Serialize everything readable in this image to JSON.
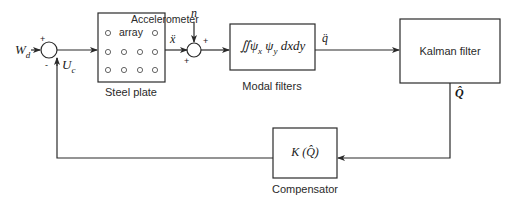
{
  "diagram": {
    "type": "block-diagram",
    "inputs": {
      "disturbance": "W",
      "disturbance_sub": "d",
      "control": "U",
      "control_sub": "c",
      "noise": "n"
    },
    "junctions": [
      {
        "id": "sum1",
        "signs": {
          "left": "+",
          "bottom": "-"
        }
      },
      {
        "id": "sum2",
        "signs": {
          "top": "+",
          "bottom_left": "+"
        }
      }
    ],
    "blocks": {
      "steel_plate": {
        "title_line1": "Accelerometer",
        "title_line2": "array",
        "caption": "Steel plate"
      },
      "modal_filters": {
        "expression": "∬ψ",
        "psi_x_sub": "x",
        "psi_y": "ψ",
        "psi_y_sub": "y",
        "differential": "dxdy",
        "caption": "Modal filters"
      },
      "kalman": {
        "label": "Kalman filter"
      },
      "compensator": {
        "expression": "K (Q̂)",
        "caption": "Compensator"
      }
    },
    "signals": {
      "x_ddot": "ẍ",
      "q_ddot": "q̈",
      "q_hat": "Q̂"
    },
    "colors": {
      "line": "#2a2a2a",
      "background": "#ffffff"
    }
  }
}
